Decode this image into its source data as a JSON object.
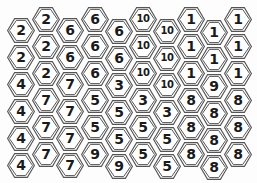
{
  "board": {
    "layout": "flat-top hexagon grid, 10 columns x 6 rows, even columns offset upward",
    "columns": [
      {
        "x": 21,
        "y0": 30,
        "values": [
          "2",
          "2",
          "4",
          "4",
          "4",
          "4"
        ]
      },
      {
        "x": 46,
        "y0": 19,
        "values": [
          "2",
          "2",
          "2",
          "7",
          "7",
          "7"
        ]
      },
      {
        "x": 70,
        "y0": 30,
        "values": [
          "6",
          "6",
          "7",
          "7",
          "7",
          "7"
        ]
      },
      {
        "x": 95,
        "y0": 19,
        "values": [
          "6",
          "6",
          "6",
          "5",
          "5",
          "9"
        ]
      },
      {
        "x": 119,
        "y0": 31,
        "values": [
          "6",
          "6",
          "3",
          "5",
          "5",
          "9"
        ]
      },
      {
        "x": 143,
        "y0": 19,
        "values": [
          "10",
          "10",
          "10",
          "3",
          "5",
          "5"
        ]
      },
      {
        "x": 167,
        "y0": 31,
        "values": [
          "10",
          "10",
          "10",
          "3",
          "5",
          "5"
        ]
      },
      {
        "x": 191,
        "y0": 19,
        "values": [
          "1",
          "1",
          "1",
          "8",
          "8",
          "8"
        ]
      },
      {
        "x": 214,
        "y0": 32,
        "values": [
          "1",
          "1",
          "9",
          "8",
          "8",
          "8"
        ]
      },
      {
        "x": 238,
        "y0": 19,
        "values": [
          "1",
          "1",
          "1",
          "8",
          "8",
          "8"
        ]
      }
    ],
    "row_step": 27,
    "colors": {
      "outline": "#555555",
      "fill": "#ffffff",
      "text": "#1a1a1a",
      "background": "#fdfdfd"
    }
  }
}
